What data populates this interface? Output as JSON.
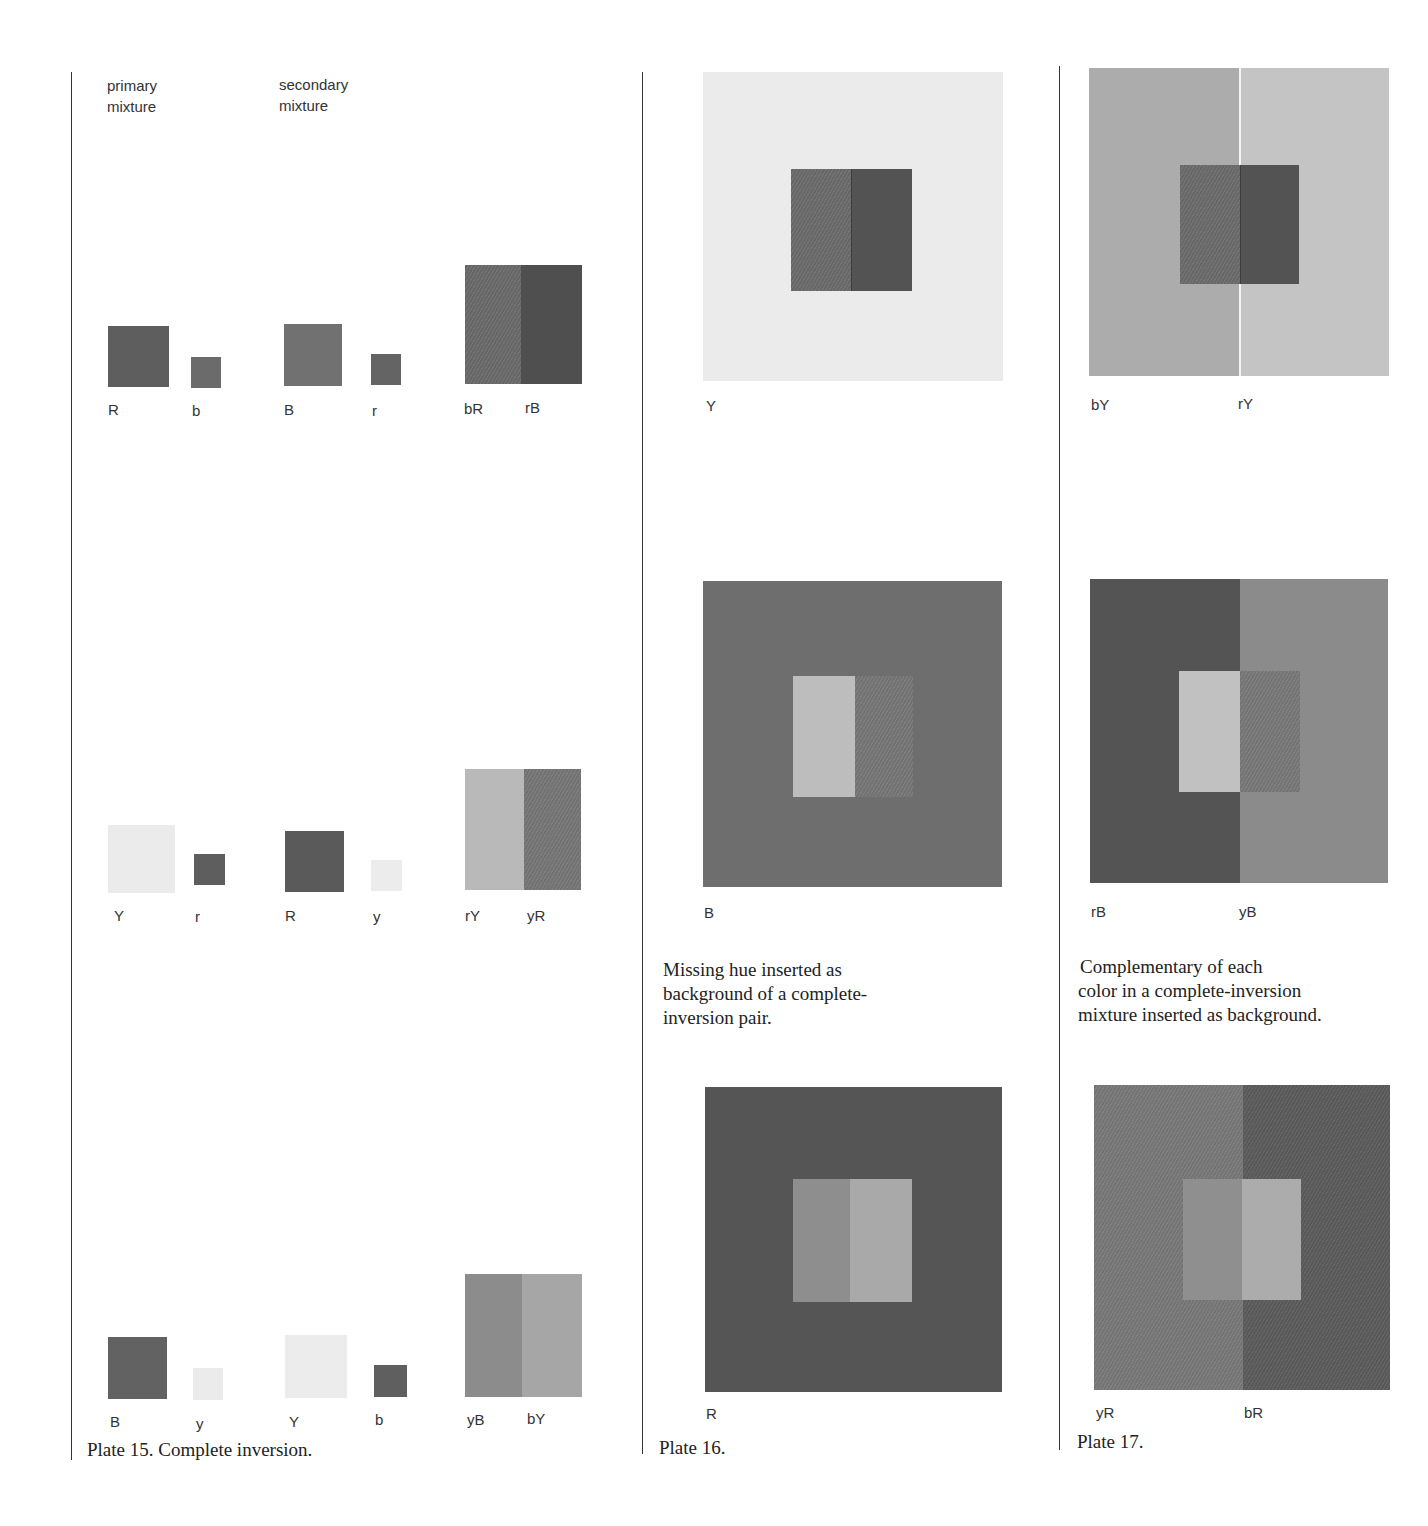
{
  "plate15": {
    "headers": {
      "primary": "primary\nmixture",
      "primary_line1": "primary",
      "primary_line2": "mixture",
      "secondary_line1": "secondary",
      "secondary_line2": "mixture"
    },
    "rows": [
      {
        "primary": [
          "R",
          "b"
        ],
        "secondary": [
          "B",
          "r"
        ],
        "result": [
          "bR",
          "rB"
        ],
        "colors": {
          "primary_big": "#5e5e5e",
          "primary_small": "#6b6b6b",
          "secondary_big": "#717171",
          "secondary_small": "#646464",
          "result_left": "#6c6c6c",
          "result_right": "#4f4f4f"
        }
      },
      {
        "primary": [
          "Y",
          "r"
        ],
        "secondary": [
          "R",
          "y"
        ],
        "result": [
          "rY",
          "yR"
        ],
        "colors": {
          "primary_big": "#ebebeb",
          "primary_small": "#5e5e5e",
          "secondary_big": "#5a5a5a",
          "secondary_small": "#ececec",
          "result_left": "#b9b9b9",
          "result_right": "#787878"
        }
      },
      {
        "primary": [
          "B",
          "y"
        ],
        "secondary": [
          "Y",
          "b"
        ],
        "result": [
          "yB",
          "bY"
        ],
        "colors": {
          "primary_big": "#626262",
          "primary_small": "#ebebeb",
          "secondary_big": "#ececec",
          "secondary_small": "#5f5f5f",
          "result_left": "#8c8c8c",
          "result_right": "#a6a6a6"
        }
      }
    ],
    "caption": "Plate 15. Complete inversion."
  },
  "plate16": {
    "panels": [
      {
        "label": "Y",
        "bg": "#ebebeb",
        "inner_left": "#6d6d6d",
        "inner_right": "#535353"
      },
      {
        "label": "B",
        "bg": "#6e6e6e",
        "inner_left": "#bdbdbd",
        "inner_right": "#787878"
      },
      {
        "label": "R",
        "bg": "#555555",
        "inner_left": "#8e8e8e",
        "inner_right": "#a9a9a9"
      }
    ],
    "description": "Missing hue inserted as background of a complete-inversion pair.",
    "description_lines": [
      "Missing hue inserted as",
      "background of a complete-",
      "inversion pair."
    ],
    "caption": "Plate 16."
  },
  "plate17": {
    "panels": [
      {
        "label_left": "bY",
        "label_right": "rY",
        "bg_left": "#acacac",
        "bg_right": "#c4c4c4",
        "inner_left": "#6d6d6d",
        "inner_right": "#535353"
      },
      {
        "label_left": "rB",
        "label_right": "yB",
        "bg_left": "#545454",
        "bg_right": "#8b8b8b",
        "inner_left": "#c1c1c1",
        "inner_right": "#7a7a7a"
      },
      {
        "label_left": "yR",
        "label_right": "bR",
        "bg_left": "#7a7a7a",
        "bg_right": "#5d5d5d",
        "inner_left": "#8f8f8f",
        "inner_right": "#acacac"
      }
    ],
    "description_lines": [
      "Complementary of each",
      "color in a complete-inversion",
      "mixture inserted as background."
    ],
    "caption": "Plate 17."
  }
}
